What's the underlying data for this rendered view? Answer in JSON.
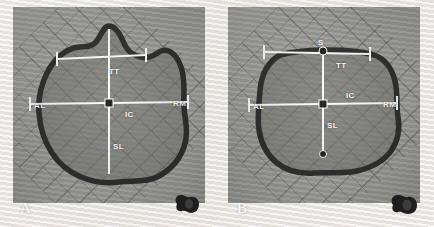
{
  "figure": {
    "panel_count": 2,
    "image_type": "anatomical-specimen-photograph",
    "colors": {
      "annotation_line": "#ffffff",
      "specimen_outline": "#2b2b2b",
      "specimen_fill": "#6e6e6c",
      "grid": "#3c3c3c",
      "background": "#a4a4a0",
      "border": "#ffffff"
    }
  },
  "panels": [
    {
      "id": "panel-a",
      "letter": "A",
      "description": "specimen cross-section with pointed superior apex",
      "labels": {
        "tt": "TT",
        "ic": "IC",
        "sl": "SL",
        "al": "AL",
        "rm": "RM"
      },
      "measurements": [
        {
          "name": "TT",
          "orientation": "horizontal-upper",
          "label": "TT"
        },
        {
          "name": "IC",
          "orientation": "horizontal-mid",
          "label": "IC"
        },
        {
          "name": "SL",
          "orientation": "vertical",
          "label": "SL"
        },
        {
          "name": "AL",
          "orientation": "endpoint-left",
          "label": "AL"
        },
        {
          "name": "RM",
          "orientation": "endpoint-right",
          "label": "RM"
        }
      ],
      "reference_object": "dark-specimen-marker"
    },
    {
      "id": "panel-b",
      "letter": "B",
      "description": "specimen cross-section with flattened superior border",
      "labels": {
        "s": "S",
        "tt": "TT",
        "ic": "IC",
        "sl": "SL",
        "al": "AL",
        "rm": "RM"
      },
      "measurements": [
        {
          "name": "S",
          "orientation": "apex-marker",
          "label": "S"
        },
        {
          "name": "TT",
          "orientation": "horizontal-upper",
          "label": "TT"
        },
        {
          "name": "IC",
          "orientation": "horizontal-mid",
          "label": "IC"
        },
        {
          "name": "SL",
          "orientation": "vertical",
          "label": "SL"
        },
        {
          "name": "AL",
          "orientation": "endpoint-left",
          "label": "AL"
        },
        {
          "name": "RM",
          "orientation": "endpoint-right",
          "label": "RM"
        }
      ],
      "reference_object": "dark-specimen-marker"
    }
  ]
}
